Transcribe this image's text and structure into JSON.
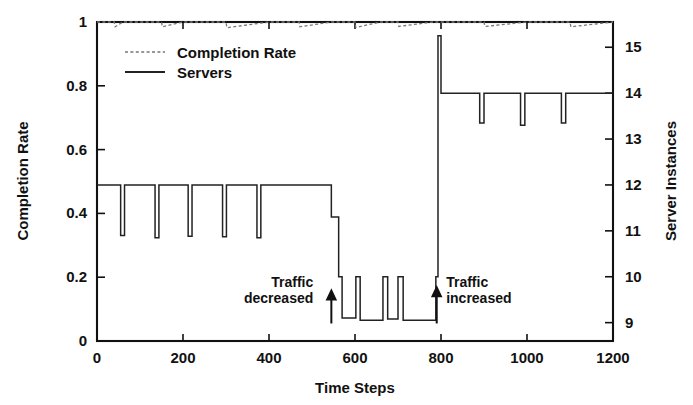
{
  "chart_data": {
    "type": "line",
    "title": "",
    "xlabel": "Time Steps",
    "ylabel": "Completion Rate",
    "y2label": "Server Instances",
    "xlim": [
      0,
      1200
    ],
    "ylim": [
      0,
      1
    ],
    "y2lim": [
      8.6,
      15.55
    ],
    "grid": false,
    "legend_position": "top-left-inside",
    "x_ticks": [
      0,
      200,
      400,
      600,
      800,
      1000,
      1200
    ],
    "x_tick_labels": [
      "0",
      "200",
      "400",
      "600",
      "800",
      "1000",
      "1200"
    ],
    "y_ticks": [
      0,
      0.2,
      0.4,
      0.6,
      0.8,
      1
    ],
    "y_tick_labels": [
      "0",
      "0.2",
      "0.4",
      "0.6",
      "0.8",
      "1"
    ],
    "y2_ticks": [
      9,
      10,
      11,
      12,
      13,
      14,
      15
    ],
    "y2_tick_labels": [
      "9",
      "10",
      "11",
      "12",
      "13",
      "14",
      "15"
    ],
    "series": [
      {
        "name": "Completion Rate",
        "axis": "left",
        "style": "dashed",
        "color": "#777777",
        "x": [
          0,
          40,
          42,
          60,
          62,
          150,
          152,
          200,
          202,
          300,
          302,
          400,
          402,
          470,
          472,
          545,
          547,
          600,
          602,
          660,
          662,
          700,
          702,
          780,
          782,
          800,
          802,
          900,
          902,
          1000,
          1002,
          1100,
          1102,
          1200
        ],
        "values": [
          1.0,
          1.0,
          0.985,
          1.0,
          1.0,
          1.0,
          0.985,
          1.0,
          1.0,
          1.0,
          0.982,
          1.0,
          1.0,
          1.0,
          0.985,
          1.0,
          1.0,
          1.0,
          0.983,
          1.0,
          1.0,
          1.0,
          0.986,
          1.0,
          1.0,
          1.0,
          1.0,
          1.0,
          0.986,
          1.0,
          1.0,
          1.0,
          0.985,
          1.0
        ]
      },
      {
        "name": "Servers",
        "axis": "right",
        "style": "solid",
        "color": "#222222",
        "description": "Step function of server instance count with periodic downward scaling spikes",
        "x": [
          0,
          55,
          55,
          64,
          64,
          135,
          135,
          144,
          144,
          212,
          212,
          221,
          221,
          292,
          292,
          301,
          301,
          372,
          372,
          381,
          381,
          545,
          545,
          562,
          562,
          570,
          570,
          602,
          602,
          612,
          612,
          665,
          665,
          676,
          676,
          700,
          700,
          712,
          712,
          788,
          788,
          793,
          793,
          800,
          800,
          890,
          890,
          900,
          900,
          985,
          985,
          995,
          995,
          1080,
          1080,
          1090,
          1090,
          1200
        ],
        "values": [
          12,
          12,
          10.9,
          10.9,
          12,
          12,
          10.85,
          10.85,
          12,
          12,
          10.88,
          10.88,
          12,
          12,
          10.87,
          10.87,
          12,
          12,
          10.85,
          10.85,
          12,
          12,
          11.3,
          11.3,
          10.0,
          10.0,
          9.1,
          9.1,
          10.0,
          10.0,
          9.05,
          9.05,
          10.0,
          10.0,
          9.08,
          9.08,
          10.0,
          10.0,
          9.05,
          9.05,
          10.0,
          10.0,
          15.25,
          15.25,
          14.0,
          14.0,
          13.35,
          13.35,
          14.0,
          14.0,
          13.3,
          13.3,
          14.0,
          14.0,
          13.35,
          13.35,
          14.0,
          14.0
        ]
      }
    ],
    "annotations": [
      {
        "id": "traffic-decreased",
        "lines": [
          "Traffic",
          "decreased"
        ],
        "arrow_x": 545,
        "arrow_from_y": 0.055,
        "arrow_to_y": 0.155,
        "text_anchor": "right-of-arrow-left",
        "label_x": 503,
        "label_y": 0.17
      },
      {
        "id": "traffic-increased",
        "lines": [
          "Traffic",
          "increased"
        ],
        "arrow_x": 790,
        "arrow_from_y": 0.055,
        "arrow_to_y": 0.165,
        "text_anchor": "left-of-arrow-right",
        "label_x": 812,
        "label_y": 0.17
      }
    ]
  },
  "legend": {
    "items": [
      {
        "label": "Completion Rate",
        "style": "dashed"
      },
      {
        "label": "Servers",
        "style": "solid"
      }
    ]
  },
  "axes": {
    "left_title": "Completion Rate",
    "right_title": "Server Instances",
    "bottom_title": "Time Steps"
  }
}
